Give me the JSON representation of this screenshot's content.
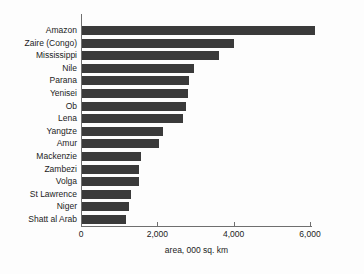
{
  "chart_data": {
    "type": "bar",
    "orientation": "horizontal",
    "title": "",
    "subtitle": "",
    "xlabel": "area, 000 sq. km",
    "ylabel": "",
    "categories": [
      "Amazon",
      "Zaire (Congo)",
      "Mississippi",
      "Nile",
      "Parana",
      "Yenisei",
      "Ob",
      "Lena",
      "Yangtze",
      "Amur",
      "Mackenzie",
      "Zambezi",
      "Volga",
      "St Lawrence",
      "Niger",
      "Shatt al Arab"
    ],
    "values": [
      6100,
      3980,
      3590,
      2940,
      2800,
      2780,
      2730,
      2650,
      2120,
      2020,
      1550,
      1490,
      1490,
      1290,
      1230,
      1150
    ],
    "xlim": [
      0,
      6050
    ],
    "xticks": [
      0,
      2000,
      4000,
      6000
    ],
    "xticklabels": [
      "0",
      "2,000",
      "4,000",
      "6,000"
    ],
    "grid": false,
    "legend": null,
    "bar_color": "#3a3a3a",
    "axis_color": "#6f6f6f",
    "background_color": "#fdfdfd",
    "text_color": "#1c1c1c"
  }
}
